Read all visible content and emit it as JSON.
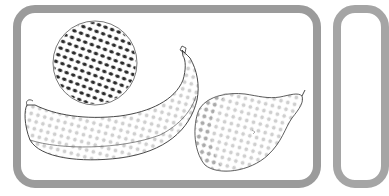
{
  "illustration": {
    "subject": "fruit-sketch",
    "items": [
      {
        "name": "orange",
        "shading": "dark-dots"
      },
      {
        "name": "banana",
        "shading": "light-dots"
      },
      {
        "name": "pear",
        "shading": "light-dots"
      }
    ]
  },
  "colors": {
    "frame": "#9b9b9b",
    "ink": "#2a2a2a",
    "light_dots": "#c8c8c8",
    "background": "#ffffff"
  }
}
